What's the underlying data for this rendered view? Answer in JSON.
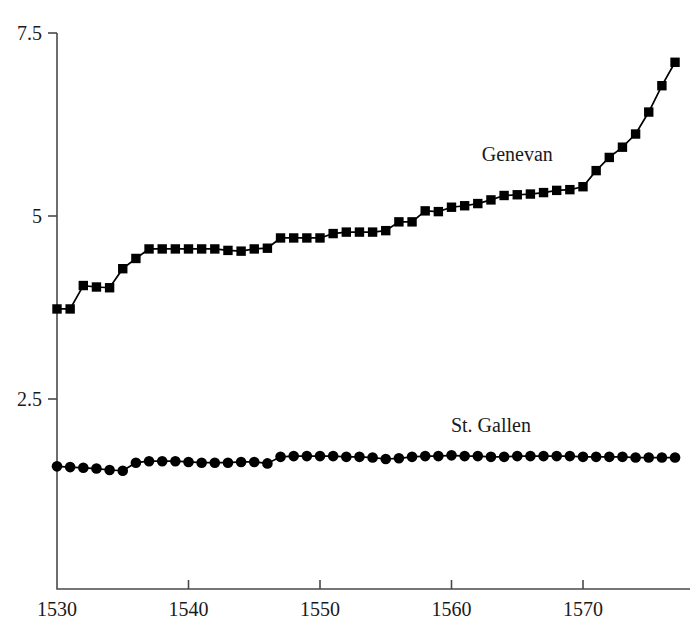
{
  "chart_data": {
    "type": "line",
    "title": "",
    "subtitle": "",
    "xlabel": "",
    "ylabel": "",
    "xlim": [
      1529.2,
      1578.0
    ],
    "ylim": [
      0.0,
      7.9
    ],
    "grid": false,
    "legend_position": "inline-annotation",
    "xticks": [
      1530,
      1540,
      1550,
      1560,
      1570
    ],
    "xtick_labels": [
      "1530",
      "1540",
      "1550",
      "1560",
      "1570"
    ],
    "yticks": [
      2.5,
      5,
      7.5
    ],
    "ytick_labels": [
      "2.5",
      "5",
      "7.5"
    ],
    "x": [
      1530,
      1531,
      1532,
      1533,
      1534,
      1535,
      1536,
      1537,
      1538,
      1539,
      1540,
      1541,
      1542,
      1543,
      1544,
      1545,
      1546,
      1547,
      1548,
      1549,
      1550,
      1551,
      1552,
      1553,
      1554,
      1555,
      1556,
      1557,
      1558,
      1559,
      1560,
      1561,
      1562,
      1563,
      1564,
      1565,
      1566,
      1567,
      1568,
      1569,
      1570,
      1571,
      1572,
      1573,
      1574,
      1575,
      1576,
      1577
    ],
    "series": [
      {
        "name": "Genevan",
        "marker": "square",
        "color": "#000000",
        "label_x": 1565.0,
        "label_y": 5.75,
        "values": [
          3.73,
          3.73,
          4.05,
          4.03,
          4.02,
          4.28,
          4.42,
          4.55,
          4.55,
          4.55,
          4.55,
          4.55,
          4.55,
          4.53,
          4.52,
          4.55,
          4.56,
          4.7,
          4.7,
          4.7,
          4.7,
          4.76,
          4.78,
          4.78,
          4.78,
          4.8,
          4.92,
          4.92,
          5.07,
          5.06,
          5.12,
          5.14,
          5.17,
          5.22,
          5.28,
          5.29,
          5.3,
          5.32,
          5.35,
          5.36,
          5.4,
          5.62,
          5.8,
          5.94,
          6.12,
          6.42,
          6.78,
          7.1
        ]
      },
      {
        "name": "St. Gallen",
        "marker": "circle",
        "color": "#000000",
        "label_x": 1563.0,
        "label_y": 2.05,
        "values": [
          1.58,
          1.57,
          1.56,
          1.55,
          1.53,
          1.52,
          1.63,
          1.65,
          1.65,
          1.65,
          1.64,
          1.63,
          1.63,
          1.63,
          1.64,
          1.64,
          1.62,
          1.71,
          1.72,
          1.72,
          1.72,
          1.72,
          1.71,
          1.71,
          1.7,
          1.68,
          1.69,
          1.71,
          1.72,
          1.72,
          1.73,
          1.72,
          1.72,
          1.71,
          1.71,
          1.72,
          1.72,
          1.72,
          1.72,
          1.72,
          1.71,
          1.71,
          1.71,
          1.71,
          1.7,
          1.7,
          1.7,
          1.7
        ]
      }
    ]
  },
  "axes": {
    "y_axis_name": "y-axis",
    "x_axis_name": "x-axis"
  }
}
